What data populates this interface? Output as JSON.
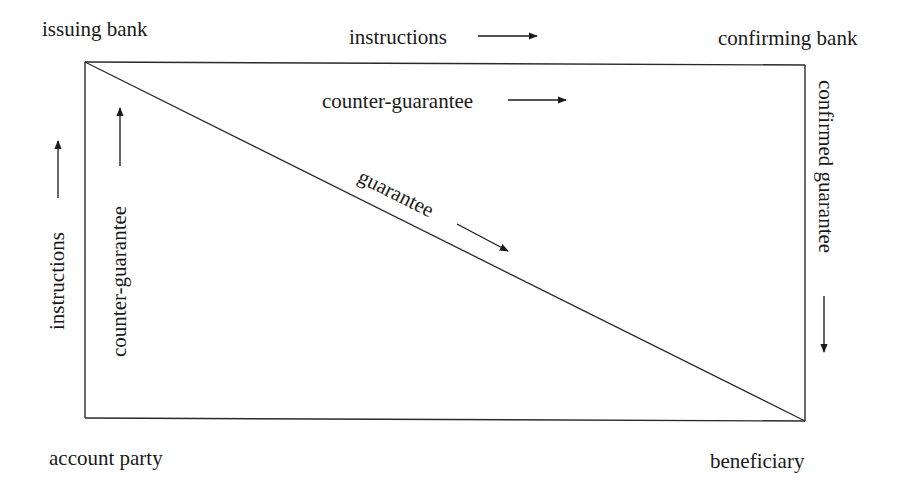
{
  "diagram": {
    "nodes": {
      "issuing_bank": "issuing bank",
      "confirming_bank": "confirming bank",
      "account_party": "account party",
      "beneficiary": "beneficiary"
    },
    "edges": {
      "top_outer": "instructions",
      "top_inner": "counter-guarantee",
      "left_outer": "instructions",
      "left_inner": "counter-guarantee",
      "diagonal": "guarantee",
      "right": "confirmed guarantee"
    },
    "arrow_directions": {
      "top_outer": "right",
      "top_inner": "right",
      "left_outer": "up",
      "left_inner": "up",
      "diagonal": "down-right",
      "right": "down"
    },
    "colors": {
      "line": "#2a2a2a",
      "text": "#1a1a1a",
      "background": "#ffffff"
    }
  }
}
